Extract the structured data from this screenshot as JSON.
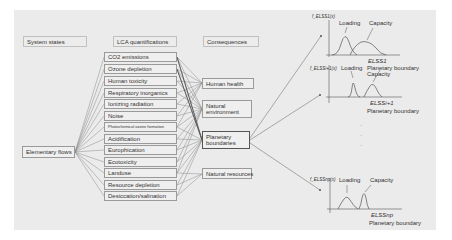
{
  "headers": {
    "system_states": "System states",
    "lca_quantifications": "LCA quantifications",
    "consequences": "Consequences"
  },
  "system_state": {
    "label": "Elementary flows"
  },
  "lca_items": [
    "CO2 emissions",
    "Ozone depletion",
    "Human toxicity",
    "Respiratory inorganics",
    "Ionizing radiation",
    "Noise",
    "Photochemical ozone formation",
    "Acidification",
    "Europhication",
    "Ecotoxicity",
    "Landuse",
    "Resource depletion",
    "Desiccation/salination"
  ],
  "consequences": [
    {
      "label": "Human health"
    },
    {
      "label": "Natural environment"
    },
    {
      "label": "Planetary boundaries",
      "highlighted": true
    },
    {
      "label": "Natural resources"
    }
  ],
  "charts": [
    {
      "y_label": "f_ELSS1(x)",
      "loading_label": "Loading",
      "capacity_label": "Capacity",
      "x_label": "ELSS1",
      "boundary_label": "Planetary boundary"
    },
    {
      "y_label": "f_ELSSi+1(x)",
      "loading_label": "Loading",
      "capacity_label": "Capacity",
      "x_label": "ELSSi+1",
      "boundary_label": "Planetary boundary"
    },
    {
      "y_label": "f_ELSSnp(x)",
      "loading_label": "Loading",
      "capacity_label": "Capacity",
      "x_label": "ELSSnp",
      "boundary_label": "Planetary boundary"
    }
  ],
  "ellipsis": [
    "·",
    "·",
    "·"
  ],
  "colors": {
    "panel": "#ebebeb",
    "box_border": "#9a9a9a",
    "wire": "#777777",
    "highlight_border": "#555555"
  }
}
